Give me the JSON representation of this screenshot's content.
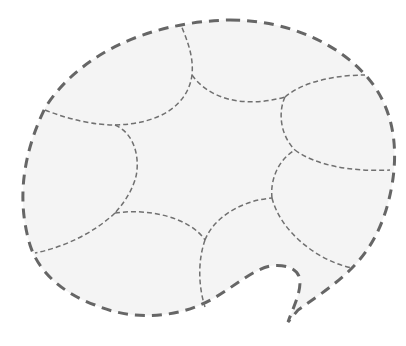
{
  "figure": {
    "type": "speech-bubble-diagram",
    "colors": {
      "background": "#ffffff",
      "fill": "#f4f4f4",
      "outline": "#666666",
      "seams": "#707070"
    },
    "segments_count": 8,
    "has_tail": true,
    "tail_position": "bottom-right"
  }
}
